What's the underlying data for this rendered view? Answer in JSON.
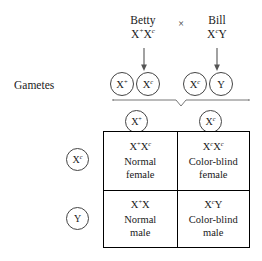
{
  "diagram": {
    "type": "punnett-square",
    "topic": "X-linked color blindness cross"
  },
  "parents": {
    "cross_symbol": "×",
    "mother": {
      "name": "Betty",
      "genotype_plain": "X+Xc",
      "allele1_base": "X",
      "allele1_sup": "+",
      "allele2_base": "X",
      "allele2_sup": "c"
    },
    "father": {
      "name": "Bill",
      "genotype_plain": "XcY",
      "allele1_base": "X",
      "allele1_sup": "c",
      "allele2_base": "Y",
      "allele2_sup": ""
    }
  },
  "gametes": {
    "label": "Gametes",
    "mother_gametes": [
      {
        "base": "X",
        "sup": "+"
      },
      {
        "base": "X",
        "sup": "c"
      }
    ],
    "father_gametes": [
      {
        "base": "X",
        "sup": "c"
      },
      {
        "base": "Y",
        "sup": ""
      }
    ]
  },
  "grid": {
    "column_headers": [
      {
        "base": "X",
        "sup": "+"
      },
      {
        "base": "X",
        "sup": "c"
      }
    ],
    "row_headers": [
      {
        "base": "X",
        "sup": "c"
      },
      {
        "base": "Y",
        "sup": ""
      }
    ],
    "cells": [
      {
        "genotype_plain": "X+Xc",
        "g1_base": "X",
        "g1_sup": "+",
        "g2_base": "X",
        "g2_sup": "c",
        "line1": "Normal",
        "line2": "female"
      },
      {
        "genotype_plain": "XcXc",
        "g1_base": "X",
        "g1_sup": "c",
        "g2_base": "X",
        "g2_sup": "c",
        "line1": "Color-blind",
        "line2": "female"
      },
      {
        "genotype_plain": "X+X",
        "g1_base": "X",
        "g1_sup": "+",
        "g2_base": "X",
        "g2_sup": "",
        "line1": "Normal",
        "line2": "male"
      },
      {
        "genotype_plain": "XcY",
        "g1_base": "X",
        "g1_sup": "c",
        "g2_base": "Y",
        "g2_sup": "",
        "line1": "Color-blind",
        "line2": "male"
      }
    ]
  },
  "colors": {
    "ink": "#1a1a1a",
    "rule": "#000000",
    "circle_stroke": "#444444",
    "background": "#ffffff"
  }
}
